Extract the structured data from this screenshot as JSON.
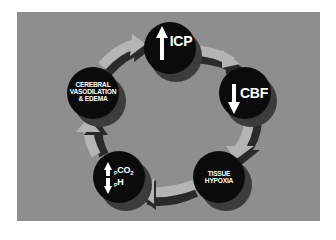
{
  "diagram": {
    "type": "cycle",
    "direction": "clockwise",
    "colors": {
      "background": "#8e8e8e",
      "node_fill": "#0b0b0b",
      "node_shadow": "#3c3c3c",
      "arrow_fill": "#b4b4b4",
      "arrow_shadow": "#2a2a2a",
      "text": "#ffffff"
    },
    "nodes": [
      {
        "id": "icp",
        "label": "ICP",
        "indicator": "up-arrow",
        "meaning": "increased intracranial pressure"
      },
      {
        "id": "cbf",
        "label": "CBF",
        "indicator": "down-arrow",
        "meaning": "decreased cerebral blood flow"
      },
      {
        "id": "hypoxia",
        "label_lines": [
          "TISSUE",
          "HYPOXIA"
        ]
      },
      {
        "id": "pco2-ph",
        "indicator": "up-down-arrows",
        "upper": {
          "prefix": "P",
          "main": "CO",
          "sub": "2"
        },
        "lower": {
          "prefix": "P",
          "main": "H"
        }
      },
      {
        "id": "vasodilation",
        "label_lines": [
          "CEREBRAL",
          "VASODILATION",
          "& EDEMA"
        ]
      }
    ],
    "edges": [
      {
        "from": "icp",
        "to": "cbf"
      },
      {
        "from": "cbf",
        "to": "hypoxia"
      },
      {
        "from": "hypoxia",
        "to": "pco2-ph"
      },
      {
        "from": "pco2-ph",
        "to": "vasodilation"
      },
      {
        "from": "vasodilation",
        "to": "icp"
      }
    ]
  }
}
